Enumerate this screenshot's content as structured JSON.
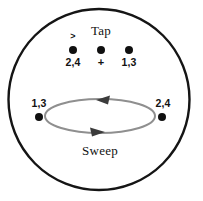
{
  "figure": {
    "title_top": "Tap",
    "title_bottom": "Sweep",
    "outer_circle": {
      "cx": 99,
      "cy": 99.5,
      "r": 90.5,
      "stroke": "#151515",
      "stroke_width": 2.4,
      "fill": "#ffffff"
    },
    "sweep_ellipse": {
      "cx": 100,
      "cy": 116,
      "rx": 55,
      "ry": 17,
      "stroke": "#8f8f8f",
      "stroke_width": 2.0,
      "fill": "none"
    },
    "arrows": [
      {
        "name": "sweep-arrow-top",
        "direction": "left",
        "x": 106,
        "y": 100,
        "color": "#3b3b3b"
      },
      {
        "name": "sweep-arrow-bottom",
        "direction": "right",
        "x": 96,
        "y": 132,
        "color": "#3b3b3b"
      }
    ],
    "tap_row": {
      "dot_color": "#101010",
      "dot_radius": 4.0,
      "dot_y": 50,
      "items": [
        {
          "label": "2,4",
          "dot_x": 73,
          "label_x": 73,
          "label_y": 58,
          "mark": ">"
        },
        {
          "label": "+",
          "dot_x": 101,
          "label_x": 101,
          "label_y": 58,
          "mark": ""
        },
        {
          "label": "1,3",
          "dot_x": 129,
          "label_x": 129,
          "label_y": 58,
          "mark": ""
        }
      ],
      "mark_symbol": ">",
      "mark_x": 73,
      "mark_y": 33
    },
    "side_points": [
      {
        "name": "left-side-point",
        "label": "1,3",
        "dot_x": 39,
        "dot_y": 117,
        "label_x": 39,
        "label_y": 99
      },
      {
        "name": "right-side-point",
        "label": "2,4",
        "dot_x": 162,
        "dot_y": 117,
        "label_x": 162,
        "label_y": 99
      }
    ],
    "colors": {
      "ink": "#121212",
      "circle_stroke": "#151515",
      "ellipse_stroke": "#8f8f8f",
      "arrow_fill": "#3b3b3b",
      "dot_fill": "#101010",
      "background": "#ffffff"
    }
  }
}
